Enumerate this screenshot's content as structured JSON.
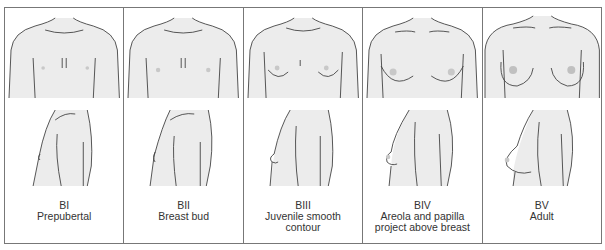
{
  "figure": {
    "colors": {
      "skin": "#ececec",
      "line": "#444444",
      "border": "#777777",
      "areola": "#c8c8c8"
    },
    "stages": [
      {
        "code": "BI",
        "description": "Prepubertal",
        "level": 0
      },
      {
        "code": "BII",
        "description": "Breast bud",
        "level": 1
      },
      {
        "code": "BIII",
        "description": "Juvenile smooth contour",
        "line1": "Juvenile smooth",
        "line2": "contour",
        "level": 2
      },
      {
        "code": "BIV",
        "description": "Areola and papilla project above breast",
        "line1": "Areola and papilla",
        "line2": "project above breast",
        "level": 3
      },
      {
        "code": "BV",
        "description": "Adult",
        "level": 4
      }
    ]
  }
}
